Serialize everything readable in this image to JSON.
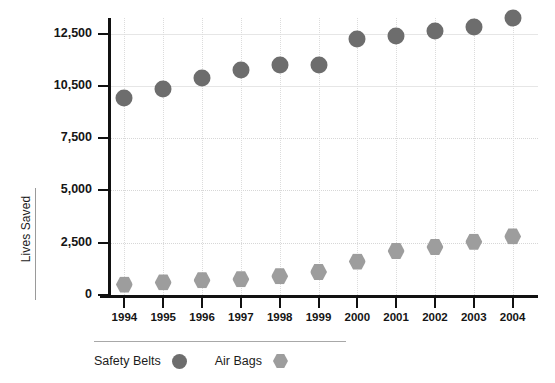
{
  "chart_data": {
    "type": "scatter",
    "title": "",
    "subtitle": "",
    "xlabel": "",
    "ylabel": "Lives Saved",
    "grid": true,
    "legend_position": "bottom",
    "categories": [
      "1994",
      "1995",
      "1996",
      "1997",
      "1998",
      "1999",
      "2000",
      "2001",
      "2002",
      "2003",
      "2004"
    ],
    "x": [
      1994,
      1995,
      1996,
      1997,
      1998,
      1999,
      2000,
      2001,
      2002,
      2003,
      2004
    ],
    "ytick_labels": [
      "0",
      "2,500",
      "5,000",
      "7,500",
      "10,500",
      "12,500"
    ],
    "ytick_values": [
      0,
      2500,
      5000,
      7500,
      10500,
      12500
    ],
    "ylim": [
      0,
      13500
    ],
    "series": [
      {
        "name": "Safety Belts",
        "marker": "circle",
        "color": "#6d6d6d",
        "values": [
          9800,
          10300,
          10800,
          11100,
          11300,
          11300,
          12300,
          12400,
          12600,
          12750,
          13100
        ]
      },
      {
        "name": "Air Bags",
        "marker": "hexagon",
        "color": "#9d9d9d",
        "values": [
          500,
          600,
          700,
          750,
          900,
          1100,
          1600,
          2100,
          2300,
          2550,
          2800
        ]
      }
    ]
  },
  "axes": {
    "y_title": "Lives Saved"
  },
  "legend": {
    "items": [
      {
        "label": "Safety Belts",
        "marker": "circle-marker-icon"
      },
      {
        "label": "Air Bags",
        "marker": "hexagon-marker-icon"
      }
    ]
  },
  "colors": {
    "safety_belts": "#6d6d6d",
    "air_bags": "#9d9d9d",
    "axis": "#111111",
    "grid": "#d7d7d7"
  }
}
